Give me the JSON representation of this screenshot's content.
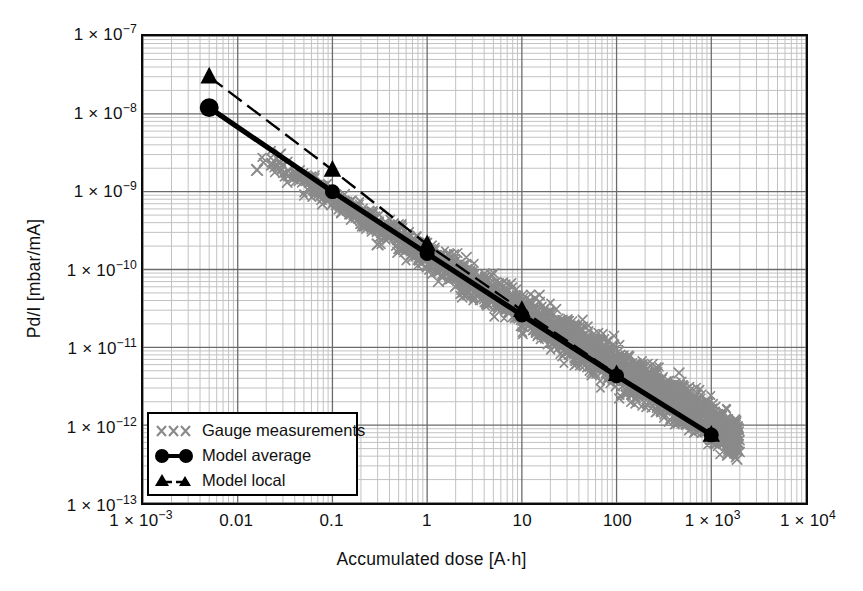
{
  "chart_data": {
    "type": "scatter",
    "title": "",
    "xlabel": "Accumulated dose  [A·h]",
    "ylabel": "Pd/I [mbar/mA]",
    "xscale": "log",
    "yscale": "log",
    "xlim": [
      0.001,
      10000
    ],
    "ylim": [
      1e-13,
      1e-07
    ],
    "grid": true,
    "minor_grid": true,
    "legend_position": "lower-left-inside",
    "xticklabels": [
      "1 × 10",
      "0.01",
      "0.1",
      "1",
      "10",
      "100",
      "1 × 10",
      "1 × 10"
    ],
    "xticks": [
      {
        "value": 0.001,
        "mantissa": "1 × 10",
        "exponent": "−3",
        "label": "1 × 10⁻³"
      },
      {
        "value": 0.01,
        "mantissa": "0.01",
        "exponent": "",
        "label": "0.01"
      },
      {
        "value": 0.1,
        "mantissa": "0.1",
        "exponent": "",
        "label": "0.1"
      },
      {
        "value": 1,
        "mantissa": "1",
        "exponent": "",
        "label": "1"
      },
      {
        "value": 10,
        "mantissa": "10",
        "exponent": "",
        "label": "10"
      },
      {
        "value": 100,
        "mantissa": "100",
        "exponent": "",
        "label": "100"
      },
      {
        "value": 1000,
        "mantissa": "1 × 10",
        "exponent": "3",
        "label": "1 × 10³"
      },
      {
        "value": 10000,
        "mantissa": "1 × 10",
        "exponent": "4",
        "label": "1 × 10⁴"
      }
    ],
    "yticks": [
      {
        "value": 1e-07,
        "mantissa": "1 × 10",
        "exponent": "−7",
        "label": "1 × 10⁻⁷"
      },
      {
        "value": 1e-08,
        "mantissa": "1 × 10",
        "exponent": "−8",
        "label": "1 × 10⁻⁸"
      },
      {
        "value": 1e-09,
        "mantissa": "1 × 10",
        "exponent": "−9",
        "label": "1 × 10⁻⁹"
      },
      {
        "value": 1e-10,
        "mantissa": "1 × 10",
        "exponent": "−10",
        "label": "1 × 10⁻¹⁰"
      },
      {
        "value": 1e-11,
        "mantissa": "1 × 10",
        "exponent": "−11",
        "label": "1 × 10⁻¹¹"
      },
      {
        "value": 1e-12,
        "mantissa": "1 × 10",
        "exponent": "−12",
        "label": "1 × 10⁻¹²"
      },
      {
        "value": 1e-13,
        "mantissa": "1 × 10",
        "exponent": "−13",
        "label": "1 × 10⁻¹³"
      }
    ],
    "series": [
      {
        "name": "Gauge measurements",
        "marker": "x",
        "color": "#8a8a8a",
        "style": "scatter",
        "description": "Dense band of gauge measurement crosses following a power-law decay from ~4e-9 at dose 0.02 down to ~6e-13 at dose ~2000",
        "band": {
          "x_start": 0.015,
          "x_end": 2000,
          "y_at_x_start": 3.2e-09,
          "y_at_x_end": 7e-13,
          "slope_decades_per_decade": -0.72,
          "spread_decades": 0.18
        },
        "outliers": [
          {
            "x": 0.016,
            "y": 1.9e-09
          },
          {
            "x": 0.028,
            "y": 3e-09
          },
          {
            "x": 0.3,
            "y": 2.1e-10
          },
          {
            "x": 1.9,
            "y": 1e-10
          },
          {
            "x": 2.6,
            "y": 9.5e-11
          },
          {
            "x": 4.2,
            "y": 5.5e-11
          },
          {
            "x": 55,
            "y": 9e-12
          },
          {
            "x": 140,
            "y": 4.5e-12
          },
          {
            "x": 430,
            "y": 2e-12
          },
          {
            "x": 900,
            "y": 1.4e-12
          },
          {
            "x": 1500,
            "y": 4.2e-13
          },
          {
            "x": 1700,
            "y": 5e-13
          }
        ]
      },
      {
        "name": "Model average",
        "marker": "circle",
        "color": "#000000",
        "style": "solid",
        "points": [
          {
            "x": 0.005,
            "y": 1.2e-08
          },
          {
            "x": 0.1,
            "y": 1e-09
          },
          {
            "x": 1,
            "y": 1.6e-10
          },
          {
            "x": 10,
            "y": 2.6e-11
          },
          {
            "x": 100,
            "y": 4.3e-12
          },
          {
            "x": 1000,
            "y": 7.5e-13
          }
        ]
      },
      {
        "name": "Model local",
        "marker": "triangle",
        "color": "#000000",
        "style": "dashed",
        "points": [
          {
            "x": 0.005,
            "y": 3e-08
          },
          {
            "x": 0.1,
            "y": 1.9e-09
          },
          {
            "x": 1,
            "y": 2.1e-10
          },
          {
            "x": 10,
            "y": 3e-11
          },
          {
            "x": 100,
            "y": 4.5e-12
          },
          {
            "x": 1000,
            "y": 7.5e-13
          }
        ]
      }
    ]
  },
  "legend": {
    "items": [
      {
        "label": "Gauge measurements",
        "symbol": "xxx-gray"
      },
      {
        "label": "Model average",
        "symbol": "circle-line-black"
      },
      {
        "label": "Model local",
        "symbol": "triangle-dashed-black"
      }
    ]
  },
  "colors": {
    "axis": "#0a0a0a",
    "major_grid": "#6b6b6b",
    "minor_grid": "#c2c2c2",
    "scatter": "#8a8a8a",
    "model": "#000000",
    "background": "#ffffff"
  }
}
